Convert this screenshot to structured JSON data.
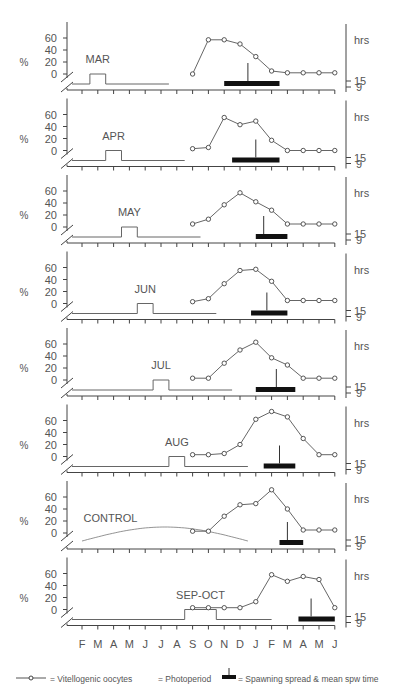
{
  "chart_data": {
    "type": "line",
    "months": [
      "F",
      "M",
      "A",
      "M",
      "J",
      "J",
      "A",
      "S",
      "O",
      "N",
      "D",
      "J",
      "F",
      "M",
      "A",
      "M",
      "J"
    ],
    "oocyte_x": [
      "S",
      "O",
      "N",
      "D",
      "J",
      "F",
      "M",
      "A",
      "M",
      "J"
    ],
    "y_ticks": [
      0,
      20,
      40,
      60
    ],
    "ylabel": "%",
    "right_axis_label": "hrs",
    "right_ticks": [
      "15",
      "9"
    ],
    "panels": [
      {
        "name": "MAR",
        "oocytes": [
          0,
          57,
          57,
          50,
          29,
          5,
          2,
          2,
          2,
          2
        ],
        "photo_start": 1,
        "photo_end": 2,
        "spawn_start": 9,
        "spawn_end": 12.5,
        "spawn_mean": 10.5
      },
      {
        "name": "APR",
        "oocytes": [
          3,
          5,
          55,
          43,
          49,
          17,
          0,
          0,
          0,
          0
        ],
        "photo_start": 2,
        "photo_end": 3,
        "spawn_start": 9.5,
        "spawn_end": 12.5,
        "spawn_mean": 11
      },
      {
        "name": "MAY",
        "oocytes": [
          5,
          13,
          37,
          57,
          42,
          28,
          5,
          5,
          5,
          5
        ],
        "photo_start": 3,
        "photo_end": 4,
        "spawn_start": 11,
        "spawn_end": 13,
        "spawn_mean": 11.5
      },
      {
        "name": "JUN",
        "oocytes": [
          3,
          8,
          33,
          55,
          57,
          37,
          5,
          5,
          5,
          5
        ],
        "photo_start": 4,
        "photo_end": 5,
        "spawn_start": 10.7,
        "spawn_end": 13,
        "spawn_mean": 11.7
      },
      {
        "name": "JUL",
        "oocytes": [
          3,
          3,
          28,
          50,
          63,
          37,
          25,
          3,
          3,
          3
        ],
        "photo_start": 5,
        "photo_end": 6,
        "spawn_start": 11,
        "spawn_end": 13.5,
        "spawn_mean": 12.3
      },
      {
        "name": "AUG",
        "oocytes": [
          3,
          3,
          5,
          20,
          62,
          75,
          66,
          30,
          3,
          3
        ],
        "photo_start": 6,
        "photo_end": 7,
        "spawn_start": 11.5,
        "spawn_end": 13.5,
        "spawn_mean": 12.5
      },
      {
        "name": "CONTROL",
        "oocytes": [
          3,
          3,
          28,
          47,
          49,
          72,
          40,
          5,
          5,
          5
        ],
        "photo_type": "sine",
        "spawn_start": 12.5,
        "spawn_end": 14,
        "spawn_mean": 13
      },
      {
        "name": "SEP-OCT",
        "oocytes": [
          3,
          3,
          3,
          3,
          13,
          58,
          47,
          55,
          50,
          3
        ],
        "photo_start": 7,
        "photo_end": 9,
        "spawn_start": 13.7,
        "spawn_end": 16,
        "spawn_mean": 14.5
      }
    ],
    "legend": [
      {
        "symbol": "—o—",
        "label": "= Vitellogenic oocytes"
      },
      {
        "symbol": "",
        "label": "= Photoperiod"
      },
      {
        "symbol": "spawn",
        "label": "= Spawning spread & mean spw time"
      }
    ]
  }
}
